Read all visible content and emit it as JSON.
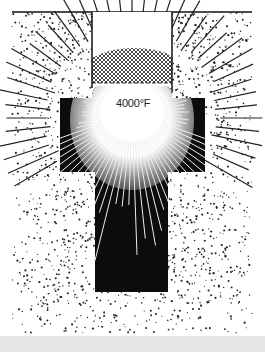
{
  "figure": {
    "temperature_label": "4000°F",
    "colors": {
      "background": "#ffffff",
      "ink": "#111111",
      "chamber": "#0c0c0c",
      "bottom_band": "#e6e6e6"
    },
    "regions": [
      {
        "name": "upper-opening",
        "label": ""
      },
      {
        "name": "crust-layer",
        "label": ""
      },
      {
        "name": "hot-chamber",
        "label": "4000°F"
      },
      {
        "name": "stem-shaft",
        "label": ""
      },
      {
        "name": "surrounding-ground",
        "label": ""
      }
    ]
  }
}
